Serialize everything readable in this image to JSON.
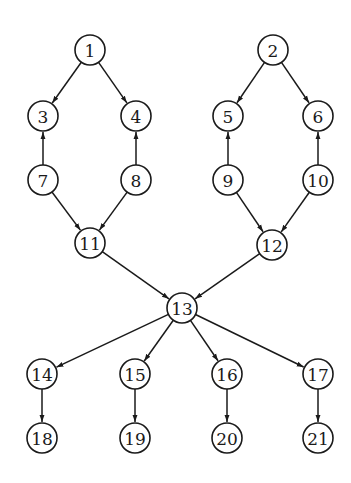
{
  "diagram": {
    "type": "directed-graph",
    "node_radius": 15,
    "colors": {
      "stroke": "#1a1a1a",
      "fill": "#ffffff",
      "background": "#ffffff"
    },
    "nodes": [
      {
        "id": "1",
        "label": "1",
        "x": 90,
        "y": 50
      },
      {
        "id": "2",
        "label": "2",
        "x": 273,
        "y": 50
      },
      {
        "id": "3",
        "label": "3",
        "x": 43,
        "y": 116
      },
      {
        "id": "4",
        "label": "4",
        "x": 136,
        "y": 116
      },
      {
        "id": "5",
        "label": "5",
        "x": 228,
        "y": 116
      },
      {
        "id": "6",
        "label": "6",
        "x": 318,
        "y": 116
      },
      {
        "id": "7",
        "label": "7",
        "x": 43,
        "y": 180
      },
      {
        "id": "8",
        "label": "8",
        "x": 136,
        "y": 180
      },
      {
        "id": "9",
        "label": "9",
        "x": 228,
        "y": 180
      },
      {
        "id": "10",
        "label": "10",
        "x": 318,
        "y": 180
      },
      {
        "id": "11",
        "label": "11",
        "x": 90,
        "y": 243
      },
      {
        "id": "12",
        "label": "12",
        "x": 272,
        "y": 245
      },
      {
        "id": "13",
        "label": "13",
        "x": 182,
        "y": 308
      },
      {
        "id": "14",
        "label": "14",
        "x": 42,
        "y": 374
      },
      {
        "id": "15",
        "label": "15",
        "x": 135,
        "y": 374
      },
      {
        "id": "16",
        "label": "16",
        "x": 227,
        "y": 374
      },
      {
        "id": "17",
        "label": "17",
        "x": 318,
        "y": 374
      },
      {
        "id": "18",
        "label": "18",
        "x": 42,
        "y": 438
      },
      {
        "id": "19",
        "label": "19",
        "x": 135,
        "y": 438
      },
      {
        "id": "20",
        "label": "20",
        "x": 227,
        "y": 438
      },
      {
        "id": "21",
        "label": "21",
        "x": 318,
        "y": 438
      }
    ],
    "edges": [
      {
        "from": "1",
        "to": "3"
      },
      {
        "from": "1",
        "to": "4"
      },
      {
        "from": "7",
        "to": "3"
      },
      {
        "from": "8",
        "to": "4"
      },
      {
        "from": "7",
        "to": "11"
      },
      {
        "from": "8",
        "to": "11"
      },
      {
        "from": "2",
        "to": "5"
      },
      {
        "from": "2",
        "to": "6"
      },
      {
        "from": "9",
        "to": "5"
      },
      {
        "from": "10",
        "to": "6"
      },
      {
        "from": "9",
        "to": "12"
      },
      {
        "from": "10",
        "to": "12"
      },
      {
        "from": "11",
        "to": "13"
      },
      {
        "from": "12",
        "to": "13"
      },
      {
        "from": "13",
        "to": "14"
      },
      {
        "from": "13",
        "to": "15"
      },
      {
        "from": "13",
        "to": "16"
      },
      {
        "from": "13",
        "to": "17"
      },
      {
        "from": "14",
        "to": "18"
      },
      {
        "from": "15",
        "to": "19"
      },
      {
        "from": "16",
        "to": "20"
      },
      {
        "from": "17",
        "to": "21"
      }
    ]
  }
}
